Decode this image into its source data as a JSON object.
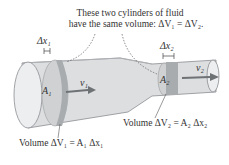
{
  "caption": {
    "line1": "These two cylinders of fluid",
    "line2": "have the same volume: ΔV₁ = ΔV₂."
  },
  "labels": {
    "dx1": "Δx₁",
    "dx2": "Δx₂",
    "a1": "A₁",
    "a2": "A₂",
    "v1": "v₁",
    "v2": "v₂",
    "volume1": "Volume ΔV₁ = A₁ Δx₁",
    "volume2": "Volume ΔV₂ = A₂ Δx₂"
  },
  "colors": {
    "pipe_fill": "#d9dbdd",
    "pipe_stroke": "#8a8d90",
    "band": "#a9acaf",
    "arrow": "#6f7275",
    "text": "#333333"
  }
}
